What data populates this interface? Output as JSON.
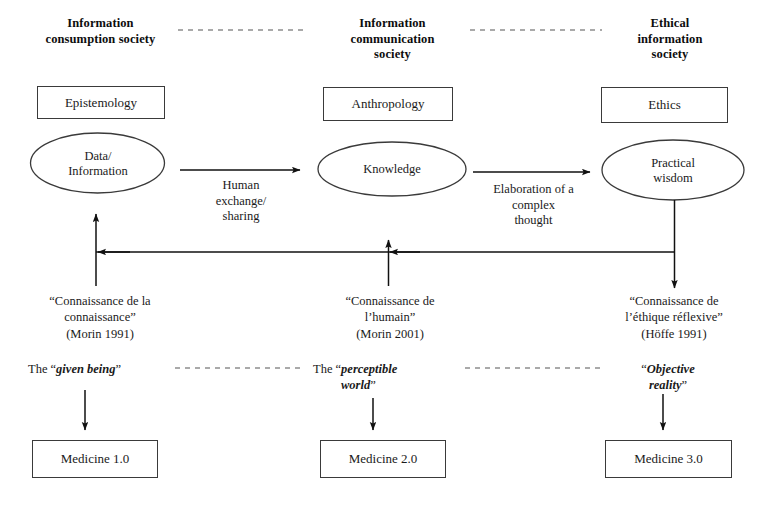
{
  "diagram": {
    "title_columns": [
      {
        "id": "col-1",
        "label": "Information\nconsumption society"
      },
      {
        "id": "col-2",
        "label": "Information\ncommunication\nsociety"
      },
      {
        "id": "col-3",
        "label": "Ethical\ninformation\nsociety"
      }
    ],
    "headers": {
      "col1": "Information consumption society",
      "col1_line1": "Information",
      "col1_line2": "consumption society",
      "col2_line1": "Information",
      "col2_line2": "communication",
      "col2_line3": "society",
      "col3_line1": "Ethical",
      "col3_line2": "information",
      "col3_line3": "society"
    },
    "discipline_boxes": [
      {
        "id": "epistemology",
        "label": "Epistemology"
      },
      {
        "id": "anthropology",
        "label": "Anthropology"
      },
      {
        "id": "ethics",
        "label": "Ethics"
      }
    ],
    "ellipses": [
      {
        "id": "data-information",
        "line1": "Data/",
        "line2": "Information"
      },
      {
        "id": "knowledge",
        "line1": "Knowledge",
        "line2": ""
      },
      {
        "id": "practical-wisdom",
        "line1": "Practical",
        "line2": "wisdom"
      }
    ],
    "transition_arrows": [
      {
        "id": "human-exchange",
        "line1": "Human",
        "line2": "exchange/",
        "line3": "sharing"
      },
      {
        "id": "elaboration",
        "line1": "Elaboration of a",
        "line2": "complex",
        "line3": "thought"
      }
    ],
    "knowledge_quotes": [
      {
        "id": "connaissance-de-la-connaissance",
        "line1": "“Connaissance de la",
        "line2": "connaissance”",
        "line3": "(Morin 1991)"
      },
      {
        "id": "connaissance-de-l-humain",
        "line1": "“Connaissance de",
        "line2": "l’humain”",
        "line3": "(Morin 2001)"
      },
      {
        "id": "connaissance-de-l-ethique-reflexive",
        "line1": "“Connaissance de",
        "line2": "l’éthique réflexive”",
        "line3": "(Höffe 1991)"
      }
    ],
    "world_phrases": [
      {
        "id": "given-being",
        "prefix": "The “",
        "emphasis": "given being",
        "suffix": "”",
        "emphasis2": "",
        "suffix2": ""
      },
      {
        "id": "perceptible-world",
        "prefix": "The “",
        "emphasis": "perceptible",
        "suffix": "",
        "emphasis2": "world",
        "suffix2": "”"
      },
      {
        "id": "objective-reality",
        "prefix": "“",
        "emphasis": "Objective",
        "suffix": "",
        "emphasis2": "reality",
        "suffix2": "”"
      }
    ],
    "medicine_boxes": [
      {
        "id": "medicine-1",
        "label": "Medicine 1.0"
      },
      {
        "id": "medicine-2",
        "label": "Medicine 2.0"
      },
      {
        "id": "medicine-3",
        "label": "Medicine 3.0"
      }
    ],
    "colors": {
      "stroke": "#3a3a3a",
      "arrow": "#111111",
      "text": "#1a1a1a",
      "background": "#ffffff"
    }
  }
}
